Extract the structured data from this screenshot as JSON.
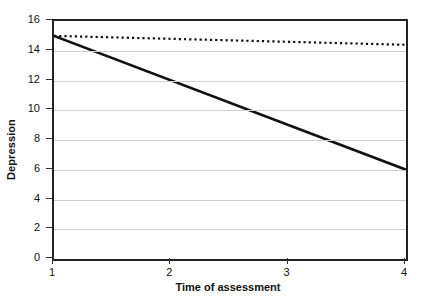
{
  "chart_data": {
    "type": "line",
    "title": "",
    "xlabel": "Time of assessment",
    "ylabel": "Depression",
    "xlim": [
      1,
      4
    ],
    "ylim": [
      0,
      16
    ],
    "xticks": [
      "1",
      "2",
      "3",
      "4"
    ],
    "yticks": [
      "0",
      "2",
      "4",
      "6",
      "8",
      "10",
      "12",
      "14",
      "16"
    ],
    "grid": "horizontal",
    "legend": "none",
    "x": [
      1,
      4
    ],
    "series": [
      {
        "name": "solid-line",
        "style": "solid",
        "color": "#111111",
        "width": 2.6,
        "values": [
          15.0,
          6.0
        ]
      },
      {
        "name": "dotted-line",
        "style": "dotted",
        "color": "#111111",
        "width": 2.2,
        "values": [
          15.0,
          14.4
        ]
      }
    ]
  },
  "axes": {
    "y_title": "Depression",
    "x_title": "Time of assessment",
    "y_tick_labels": [
      "16",
      "14",
      "12",
      "10",
      "8",
      "6",
      "4",
      "2",
      "0"
    ],
    "x_tick_labels": [
      "1",
      "2",
      "3",
      "4"
    ]
  },
  "colors": {
    "background": "#ffffff",
    "frame": "#222222",
    "gridline": "#cfcfcf",
    "ink": "#111111"
  }
}
